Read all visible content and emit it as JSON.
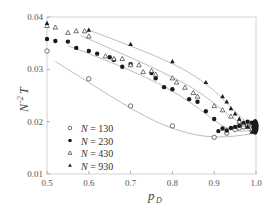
{
  "chart_data": {
    "type": "scatter",
    "title": "",
    "xlabel": "p_D",
    "ylabel": "N^-2 T",
    "xlim": [
      0.5,
      1.0
    ],
    "ylim": [
      0.01,
      0.04
    ],
    "x_ticks": [
      "0.5",
      "0.6",
      "0.7",
      "0.8",
      "0.9",
      "1.0"
    ],
    "y_ticks": [
      "0.01",
      "0.02",
      "0.03",
      "0.04"
    ],
    "grid": false,
    "legend_position": "lower-left",
    "series": [
      {
        "name": "N = 130",
        "marker": "open-circle",
        "points": [
          [
            0.5,
            0.0335
          ],
          [
            0.6,
            0.0282
          ],
          [
            0.7,
            0.023
          ],
          [
            0.8,
            0.0192
          ],
          [
            0.9,
            0.017
          ],
          [
            0.93,
            0.0178
          ],
          [
            0.95,
            0.0185
          ],
          [
            0.96,
            0.0188
          ],
          [
            0.97,
            0.019
          ],
          [
            0.98,
            0.0192
          ],
          [
            0.99,
            0.0195
          ],
          [
            0.995,
            0.0196
          ]
        ],
        "fit_curve": [
          [
            0.52,
            0.0315
          ],
          [
            0.6,
            0.0275
          ],
          [
            0.7,
            0.0225
          ],
          [
            0.78,
            0.0192
          ],
          [
            0.85,
            0.0175
          ],
          [
            0.9,
            0.017
          ],
          [
            0.95,
            0.0172
          ],
          [
            1.0,
            0.0178
          ]
        ]
      },
      {
        "name": "N = 230",
        "marker": "filled-circle",
        "points": [
          [
            0.5,
            0.0358
          ],
          [
            0.52,
            0.0354
          ],
          [
            0.55,
            0.0353
          ],
          [
            0.57,
            0.0341
          ],
          [
            0.6,
            0.0335
          ],
          [
            0.62,
            0.033
          ],
          [
            0.65,
            0.0323
          ],
          [
            0.66,
            0.0318
          ],
          [
            0.68,
            0.0305
          ],
          [
            0.7,
            0.031
          ],
          [
            0.75,
            0.0293
          ],
          [
            0.76,
            0.0283
          ],
          [
            0.78,
            0.0266
          ],
          [
            0.8,
            0.0262
          ],
          [
            0.84,
            0.0243
          ],
          [
            0.86,
            0.0238
          ],
          [
            0.88,
            0.022
          ],
          [
            0.9,
            0.0205
          ],
          [
            0.91,
            0.0182
          ],
          [
            0.92,
            0.0187
          ],
          [
            0.93,
            0.0183
          ],
          [
            0.94,
            0.0188
          ],
          [
            0.95,
            0.019
          ],
          [
            0.96,
            0.0192
          ],
          [
            0.97,
            0.0197
          ],
          [
            0.98,
            0.02
          ],
          [
            0.99,
            0.0198
          ]
        ],
        "fit_curve": [
          [
            0.55,
            0.0345
          ],
          [
            0.65,
            0.0315
          ],
          [
            0.75,
            0.028
          ],
          [
            0.82,
            0.025
          ],
          [
            0.88,
            0.0215
          ],
          [
            0.92,
            0.019
          ],
          [
            0.96,
            0.018
          ],
          [
            1.0,
            0.0185
          ]
        ]
      },
      {
        "name": "N = 430",
        "marker": "open-triangle",
        "points": [
          [
            0.5,
            0.0383
          ],
          [
            0.52,
            0.038
          ],
          [
            0.55,
            0.037
          ],
          [
            0.57,
            0.0373
          ],
          [
            0.59,
            0.0373
          ],
          [
            0.6,
            0.0363
          ],
          [
            0.64,
            0.0325
          ],
          [
            0.66,
            0.032
          ],
          [
            0.68,
            0.032
          ],
          [
            0.7,
            0.0308
          ],
          [
            0.72,
            0.0308
          ],
          [
            0.73,
            0.0295
          ],
          [
            0.75,
            0.0297
          ],
          [
            0.76,
            0.029
          ],
          [
            0.8,
            0.0283
          ],
          [
            0.81,
            0.0275
          ],
          [
            0.83,
            0.0265
          ],
          [
            0.85,
            0.0255
          ],
          [
            0.86,
            0.0248
          ],
          [
            0.9,
            0.023
          ],
          [
            0.92,
            0.0222
          ],
          [
            0.94,
            0.021
          ],
          [
            0.96,
            0.02
          ],
          [
            0.97,
            0.0195
          ],
          [
            0.98,
            0.019
          ],
          [
            0.99,
            0.0185
          ]
        ],
        "fit_curve": [
          [
            0.58,
            0.0365
          ],
          [
            0.65,
            0.034
          ],
          [
            0.75,
            0.0305
          ],
          [
            0.85,
            0.0265
          ],
          [
            0.9,
            0.0235
          ],
          [
            0.94,
            0.021
          ],
          [
            0.97,
            0.0192
          ],
          [
            1.0,
            0.0188
          ]
        ]
      },
      {
        "name": "N = 930",
        "marker": "filled-triangle",
        "points": [
          [
            0.5,
            0.0388
          ],
          [
            0.6,
            0.0375
          ],
          [
            0.7,
            0.0348
          ],
          [
            0.8,
            0.0315
          ],
          [
            0.88,
            0.0275
          ],
          [
            0.92,
            0.0248
          ],
          [
            0.93,
            0.0238
          ],
          [
            0.94,
            0.0225
          ],
          [
            0.95,
            0.0215
          ],
          [
            0.96,
            0.0205
          ],
          [
            0.97,
            0.0198
          ],
          [
            0.98,
            0.019
          ],
          [
            0.99,
            0.018
          ],
          [
            0.995,
            0.0195
          ],
          [
            0.998,
            0.02
          ]
        ],
        "fit_curve": [
          [
            0.6,
            0.0375
          ],
          [
            0.7,
            0.0345
          ],
          [
            0.8,
            0.0312
          ],
          [
            0.87,
            0.028
          ],
          [
            0.92,
            0.0245
          ],
          [
            0.96,
            0.021
          ],
          [
            0.99,
            0.0192
          ],
          [
            1.0,
            0.019
          ]
        ]
      }
    ],
    "cluster_at_1": {
      "x": 0.998,
      "y_range": [
        0.0175,
        0.0205
      ],
      "note": "dense overlapping markers of all series"
    }
  },
  "axes": {
    "x_label_main": "p",
    "x_label_sub": "D",
    "y_label_main": "N",
    "y_label_sup": "-2",
    "y_label_tail": "T"
  },
  "legend": [
    {
      "label": "N = 130",
      "marker": "open-circle"
    },
    {
      "label": "N = 230",
      "marker": "filled-circle"
    },
    {
      "label": "N = 430",
      "marker": "open-triangle"
    },
    {
      "label": "N = 930",
      "marker": "filled-triangle"
    }
  ],
  "colors": {
    "axis": "#9a9a9a",
    "fit_line": "#b5b5b5",
    "marker": "#1a1a1a",
    "text": "#444444"
  }
}
